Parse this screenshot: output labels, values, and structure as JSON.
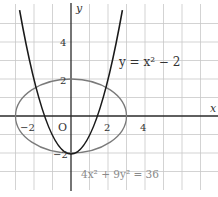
{
  "figure": {
    "axes": {
      "x_label": "x",
      "y_label": "y",
      "origin_label": "O",
      "x_ticks": [
        {
          "value": -2,
          "label": "−2"
        },
        {
          "value": 2,
          "label": "2"
        },
        {
          "value": 4,
          "label": "4"
        }
      ],
      "y_ticks": [
        {
          "value": 4,
          "label": "4"
        },
        {
          "value": 2,
          "label": "2"
        },
        {
          "value": -2,
          "label": "−2"
        }
      ],
      "x_range": [
        -3,
        8
      ],
      "y_range": [
        -4,
        6
      ],
      "grid": true
    },
    "curves": [
      {
        "name": "parabola",
        "equation_label": "y = x² − 2",
        "color": "#1a1a1a"
      },
      {
        "name": "ellipse",
        "equation_label": "4x² + 9y² = 36",
        "color": "#777777"
      }
    ],
    "labels": {
      "parabola": "y = x² − 2",
      "ellipse": "4x² + 9y² = 36",
      "x_axis": "x",
      "y_axis": "y",
      "origin": "O",
      "tick_x_neg2": "−2",
      "tick_x_2": "2",
      "tick_x_4": "4",
      "tick_y_4": "4",
      "tick_y_2": "2",
      "tick_y_neg2": "−2"
    }
  }
}
